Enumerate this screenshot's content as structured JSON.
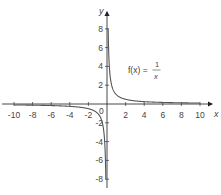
{
  "chart_data": {
    "type": "line",
    "title": "",
    "function_label": {
      "prefix": "f(x) = ",
      "numerator": "1",
      "denominator": "x"
    },
    "xlabel": "x",
    "ylabel": "y",
    "xlim": [
      -10,
      10
    ],
    "ylim": [
      -8,
      8
    ],
    "x_ticks": [
      -10,
      -8,
      -6,
      -4,
      -2,
      2,
      4,
      6,
      8,
      10
    ],
    "y_ticks": [
      -8,
      -6,
      -4,
      -2,
      2,
      4,
      6,
      8
    ],
    "origin_label": "0",
    "grid": false,
    "legend": "none",
    "series": [
      {
        "name": "f(x) = 1/x",
        "x": [
          -10,
          -8,
          -6,
          -4,
          -2,
          -1,
          -0.5,
          -0.25,
          -0.125,
          0.125,
          0.25,
          0.5,
          1,
          2,
          4,
          6,
          8,
          10
        ],
        "values": [
          -0.1,
          -0.125,
          -0.167,
          -0.25,
          -0.5,
          -1,
          -2,
          -4,
          -8,
          8,
          4,
          2,
          1,
          0.5,
          0.25,
          0.167,
          0.125,
          0.1
        ]
      }
    ],
    "colors": {
      "axis": "#333333",
      "curve": "#555555",
      "text": "#444444"
    }
  }
}
